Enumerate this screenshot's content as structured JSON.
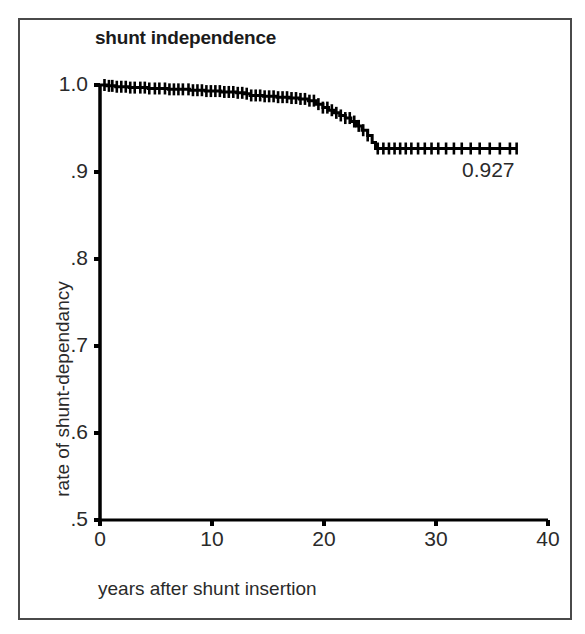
{
  "chart_data": {
    "type": "line",
    "title": "shunt independence",
    "xlabel": "years after shunt insertion",
    "ylabel": "rate of shunt-dependancy",
    "xlim": [
      0,
      40
    ],
    "ylim": [
      0.5,
      1.0
    ],
    "xticks": [
      0,
      10,
      20,
      30,
      40
    ],
    "xtick_labels": [
      "0",
      "10",
      "20",
      "30",
      "40"
    ],
    "yticks": [
      0.5,
      0.6,
      0.7,
      0.8,
      0.9,
      1.0
    ],
    "ytick_labels": [
      ".5",
      ".6",
      ".7",
      ".8",
      ".9",
      "1.0"
    ],
    "grid": false,
    "legend": null,
    "series": [
      {
        "name": "shunt independence",
        "style": "kaplan-meier-step",
        "color": "#000000",
        "final_value": 0.927,
        "x": [
          0.0,
          0.6,
          1.4,
          2.6,
          4.3,
          6.1,
          8.0,
          9.4,
          10.8,
          12.2,
          12.9,
          13.4,
          14.6,
          15.8,
          16.9,
          17.8,
          18.6,
          19.3,
          19.9,
          20.4,
          20.9,
          21.4,
          21.9,
          22.4,
          22.9,
          23.4,
          23.9,
          24.3,
          24.6,
          26.0,
          28.0,
          30.0,
          32.0,
          34.0,
          36.0,
          37.2
        ],
        "y": [
          1.0,
          0.999,
          0.998,
          0.997,
          0.996,
          0.995,
          0.994,
          0.993,
          0.992,
          0.991,
          0.99,
          0.988,
          0.987,
          0.986,
          0.985,
          0.984,
          0.982,
          0.978,
          0.974,
          0.971,
          0.968,
          0.965,
          0.962,
          0.958,
          0.953,
          0.948,
          0.942,
          0.934,
          0.927,
          0.927,
          0.927,
          0.927,
          0.927,
          0.927,
          0.927,
          0.927
        ]
      }
    ],
    "censor_marks_x": [
      0.4,
      0.8,
      1.1,
      1.5,
      1.9,
      2.3,
      2.7,
      3.1,
      3.6,
      4.0,
      4.4,
      4.9,
      5.3,
      5.8,
      6.2,
      6.6,
      7.0,
      7.4,
      7.9,
      8.3,
      8.7,
      9.1,
      9.5,
      9.9,
      10.3,
      10.7,
      11.1,
      11.5,
      11.9,
      12.3,
      12.7,
      13.1,
      13.5,
      13.9,
      14.3,
      14.7,
      15.1,
      15.5,
      15.9,
      16.3,
      16.7,
      17.1,
      17.5,
      17.9,
      18.3,
      18.7,
      19.1,
      19.5,
      19.9,
      20.3,
      20.7,
      21.1,
      21.5,
      21.9,
      22.3,
      22.7,
      23.1,
      23.5,
      23.9,
      24.8,
      25.3,
      25.8,
      26.3,
      26.8,
      27.3,
      27.8,
      28.4,
      29.0,
      29.6,
      30.2,
      30.9,
      31.6,
      32.3,
      33.1,
      33.9,
      34.8,
      35.7,
      36.6,
      37.2
    ],
    "annotations": [
      {
        "text": "0.927",
        "x": 37.2,
        "y": 0.927,
        "placement": "below-right-of-curve-end"
      }
    ]
  },
  "figure": {
    "frame_color": "#4a4a4a",
    "background": "#ffffff",
    "axis_color": "#000000",
    "curve_color": "#000000"
  }
}
